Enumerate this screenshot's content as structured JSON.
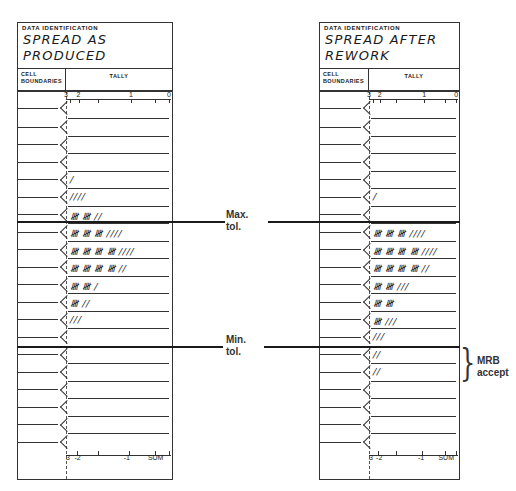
{
  "sheets": [
    {
      "id": "left",
      "header_label": "DATA IDENTIFICATION",
      "title_line1": "SPREAD AS",
      "title_line2": "PRODUCED",
      "cell_boundaries_label": "CELL BOUNDARIES",
      "tally_label": "TALLY",
      "top_scale": [
        "3",
        "2",
        "1",
        "0"
      ],
      "bottom_scale": [
        "3",
        "-2",
        "-1",
        "SUM"
      ],
      "rows": [
        "",
        "",
        "",
        "",
        "/",
        "////",
        "𝍸 𝍸 //",
        "𝍸 𝍸 𝍸 ////",
        "𝍸 𝍸 𝍸 𝍸 ////",
        "𝍸 𝍸 𝍸 𝍸 //",
        "𝍸 𝍸 /",
        "𝍸 //",
        "///",
        "",
        "",
        "",
        "",
        "",
        "",
        ""
      ],
      "row_counts": [
        0,
        0,
        0,
        0,
        1,
        4,
        12,
        19,
        24,
        22,
        11,
        7,
        3,
        0,
        0,
        0,
        0,
        0,
        0,
        0
      ]
    },
    {
      "id": "right",
      "header_label": "DATA IDENTIFICATION",
      "title_line1": "SPREAD AFTER",
      "title_line2": "REWORK",
      "cell_boundaries_label": "CELL BOUNDARIES",
      "tally_label": "TALLY",
      "top_scale": [
        "3",
        "2",
        "1",
        "0"
      ],
      "bottom_scale": [
        "3",
        "-2",
        "-1",
        "SUM"
      ],
      "rows": [
        "",
        "",
        "",
        "",
        "",
        "/",
        "",
        "𝍸 𝍸 𝍸 ////",
        "𝍸 𝍸 𝍸 𝍸 ////",
        "𝍸 𝍸 𝍸 𝍸 //",
        "𝍸 𝍸 ///",
        "𝍸 𝍸",
        "𝍸 ///",
        "///",
        "//",
        "//",
        "",
        "",
        "",
        ""
      ],
      "row_counts": [
        0,
        0,
        0,
        0,
        0,
        1,
        0,
        19,
        24,
        22,
        13,
        10,
        8,
        3,
        2,
        2,
        0,
        0,
        0,
        0
      ]
    }
  ],
  "annotations": {
    "max_tol_line1": "Max.",
    "max_tol_line2": "tol.",
    "min_tol_line1": "Min.",
    "min_tol_line2": "tol.",
    "mrb_line1": "MRB",
    "mrb_line2": "accept"
  }
}
